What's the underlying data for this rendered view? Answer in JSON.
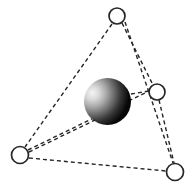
{
  "figure": {
    "name": "tetrahedral-coordination-diagram",
    "width": 192,
    "height": 186,
    "background_color": "#ffffff",
    "line_color": "#262626",
    "line_style": "dashed",
    "line_width": 1.4,
    "dash_pattern": "4 3"
  },
  "central_atom": {
    "label": "central-sphere",
    "cx": 107.5,
    "cy": 101.5,
    "r": 23.5,
    "fill_style": "radial-gradient",
    "highlight_color": "#f2f2f2",
    "mid_color": "#8c8c8c",
    "shadow_color": "#0a0a0a",
    "highlight_offset_x": "12%",
    "highlight_offset_y": "30%"
  },
  "vertices": [
    {
      "label": "vertex-top",
      "id": "v-top",
      "cx": 117,
      "cy": 16,
      "r": 8,
      "stroke": "#262626",
      "stroke_width": 1.7,
      "fill": "#ffffff"
    },
    {
      "label": "vertex-right",
      "id": "v-right",
      "cx": 157,
      "cy": 92,
      "r": 8,
      "stroke": "#262626",
      "stroke_width": 1.7,
      "fill": "#ffffff"
    },
    {
      "label": "vertex-bottom-left",
      "id": "v-bleft",
      "cx": 20,
      "cy": 155,
      "r": 8.5,
      "stroke": "#262626",
      "stroke_width": 1.7,
      "fill": "#ffffff"
    },
    {
      "label": "vertex-bottom-right",
      "id": "v-bright",
      "cx": 175,
      "cy": 172,
      "r": 8.5,
      "stroke": "#262626",
      "stroke_width": 1.7,
      "fill": "#ffffff"
    }
  ],
  "edges": [
    {
      "label": "edge-top-to-bottom-left",
      "x1": 112,
      "y1": 24,
      "x2": 25,
      "y2": 147
    },
    {
      "label": "edge-top-to-right",
      "x1": 122,
      "y1": 23,
      "x2": 153,
      "y2": 85
    },
    {
      "label": "edge-top-to-bottom-right",
      "x1": 125,
      "y1": 22,
      "x2": 173,
      "y2": 163
    },
    {
      "label": "edge-right-to-bottom-right",
      "x1": 159,
      "y1": 100,
      "x2": 174,
      "y2": 163
    },
    {
      "label": "edge-bottom-left-to-bottom-right",
      "x1": 29,
      "y1": 158,
      "x2": 166,
      "y2": 171
    },
    {
      "label": "edge-bottom-left-to-right",
      "x1": 28,
      "y1": 150,
      "x2": 149,
      "y2": 91
    }
  ],
  "bonds": [
    {
      "label": "bond-center-to-right",
      "x1": 131,
      "y1": 94,
      "x2": 149,
      "y2": 91
    },
    {
      "label": "bond-center-to-bottom-left",
      "x1": 29,
      "y1": 152,
      "x2": 95,
      "y2": 120
    }
  ],
  "legend": {
    "central_atom_label": "",
    "ligand_label": "",
    "caption": ""
  }
}
